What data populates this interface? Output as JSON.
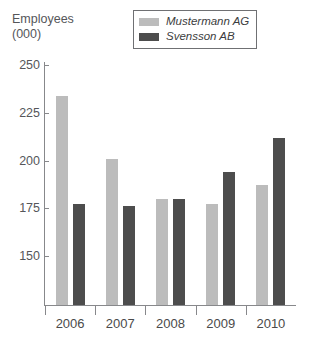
{
  "axis_title": {
    "line1": "Employees",
    "line2": "(000)"
  },
  "legend": {
    "position": "top-center",
    "entries": [
      {
        "label": "Mustermann AG",
        "color": "#bcbcbc"
      },
      {
        "label": "Svensson AB",
        "color": "#4d4d4d"
      }
    ]
  },
  "y_axis": {
    "ticks": [
      "250",
      "225",
      "200",
      "175",
      "150"
    ],
    "min": 140,
    "max": 255
  },
  "x_axis": {
    "categories": [
      "2006",
      "2007",
      "2008",
      "2009",
      "2010"
    ]
  },
  "chart_data": {
    "type": "bar",
    "title": "",
    "subtitle": "",
    "xlabel": "",
    "ylabel": "Employees (000)",
    "categories": [
      "2006",
      "2007",
      "2008",
      "2009",
      "2010"
    ],
    "series": [
      {
        "name": "Mustermann AG",
        "color": "#bcbcbc",
        "values": [
          234,
          201,
          180,
          177,
          187
        ]
      },
      {
        "name": "Svensson AB",
        "color": "#4d4d4d",
        "values": [
          177,
          176,
          180,
          194,
          212
        ]
      }
    ],
    "ylim": [
      140,
      255
    ],
    "yticks": [
      150,
      175,
      200,
      225,
      250
    ],
    "grid": false,
    "legend_position": "top-center"
  },
  "colors": {
    "series_light": "#bcbcbc",
    "series_dark": "#4d4d4d",
    "axis": "#87888b",
    "text": "#4a4a4a"
  }
}
